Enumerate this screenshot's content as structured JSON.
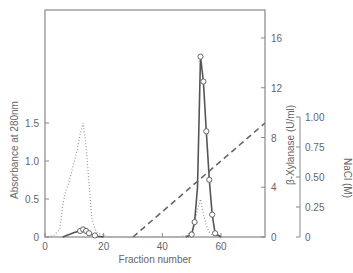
{
  "chart_data": {
    "type": "line",
    "title": "",
    "xlabel": "Fraction number",
    "ylabel_left": "Absorbance at 280nm",
    "ylabel_right": "β-Xylanase (U/ml)",
    "ylabel_right2": "NaCl (M)",
    "xlim": [
      0,
      75
    ],
    "ylim_left": [
      0,
      2.9
    ],
    "ylim_right": [
      0,
      18
    ],
    "ylim_right2": [
      0,
      1.0
    ],
    "x_ticks": [
      "0",
      "20",
      "40",
      "60"
    ],
    "y_left_ticks": [
      "0",
      "0.5",
      "1.0",
      "1.5"
    ],
    "y_right_ticks": [
      "0",
      "4",
      "8",
      "12",
      "16"
    ],
    "y_right2_ticks": [
      "0",
      "0.25",
      "0.50",
      "0.75",
      "1.00"
    ],
    "grid": false,
    "legend": null,
    "series": [
      {
        "name": "Absorbance at 280nm",
        "axis": "left",
        "style": "dotted",
        "x": [
          0,
          3,
          5,
          6,
          7,
          8,
          9,
          10,
          11,
          12,
          13,
          14,
          15,
          16,
          17,
          18,
          20,
          22,
          45,
          48,
          50,
          51,
          52,
          53,
          54,
          55,
          56,
          57,
          58,
          60
        ],
        "values": [
          0,
          0.02,
          0.1,
          0.4,
          0.6,
          0.7,
          0.85,
          1.0,
          1.15,
          1.35,
          1.5,
          1.2,
          0.7,
          0.25,
          0.1,
          0.05,
          0.02,
          0,
          0,
          0.02,
          0.08,
          0.2,
          0.35,
          0.5,
          0.3,
          0.15,
          0.06,
          0.02,
          0.01,
          0
        ]
      },
      {
        "name": "β-Xylanase activity (small peak, fractions 6-20)",
        "axis": "left",
        "style": "solid-circles",
        "x": [
          6,
          8,
          10,
          12,
          13,
          14,
          15,
          16,
          17,
          18,
          20
        ],
        "values": [
          0,
          0.03,
          0.06,
          0.08,
          0.1,
          0.08,
          0.05,
          0.03,
          0.02,
          0.01,
          0
        ]
      },
      {
        "name": "β-Xylanase (U/ml)",
        "axis": "right",
        "style": "solid-circles",
        "x": [
          48,
          50,
          51,
          52,
          53,
          54,
          55,
          56,
          57,
          58,
          60
        ],
        "values": [
          0,
          0.2,
          1.2,
          4,
          14.5,
          12.5,
          8.5,
          4.6,
          1.8,
          0.3,
          0
        ]
      },
      {
        "name": "NaCl (M)",
        "axis": "right2",
        "style": "dashed",
        "x": [
          30,
          75
        ],
        "values": [
          0,
          0.95
        ]
      }
    ]
  }
}
